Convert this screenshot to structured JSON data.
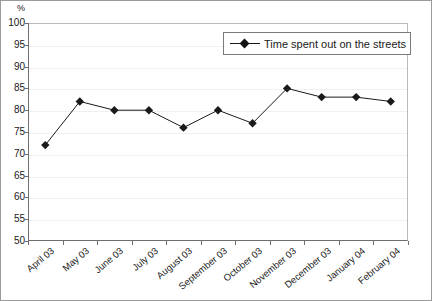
{
  "chart_data": {
    "type": "line",
    "title": "",
    "xlabel": "",
    "ylabel": "%",
    "unit_label": "%",
    "ylim": [
      50,
      100
    ],
    "ytick_step": 5,
    "yticks": [
      50,
      55,
      60,
      65,
      70,
      75,
      80,
      85,
      90,
      95,
      100
    ],
    "grid": true,
    "legend_position": "top-right",
    "categories": [
      "April 03",
      "May 03",
      "June 03",
      "July 03",
      "August 03",
      "September 03",
      "October 03",
      "November 03",
      "December 03",
      "January 04",
      "February 04"
    ],
    "series": [
      {
        "name": "Time spent out on the streets",
        "values": [
          72,
          82,
          80,
          80,
          76,
          80,
          77,
          85,
          83,
          83,
          82
        ],
        "color": "#1a1a1a",
        "marker": "diamond"
      }
    ]
  },
  "legend": {
    "entries": [
      {
        "label": "Time spent out on the streets"
      }
    ]
  },
  "colors": {
    "series_line": "#1a1a1a",
    "marker_fill": "#111111",
    "gridline": "#f0f0f0",
    "axis": "#6f6f6f",
    "border": "#9a9a9a",
    "text": "#1a1a1a"
  }
}
